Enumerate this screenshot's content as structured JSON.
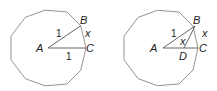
{
  "figures": [
    {
      "shape": "regular decagon",
      "labels": {
        "A": "A",
        "B": "B",
        "C": "C",
        "AB": "1",
        "AC": "1",
        "BC": "x"
      }
    },
    {
      "shape": "regular decagon",
      "labels": {
        "A": "A",
        "B": "B",
        "C": "C",
        "D": "D",
        "AB": "1",
        "BD": "x",
        "BC": "x"
      }
    }
  ],
  "colors": {
    "stroke": "#888888",
    "segment": "#555555",
    "text": "#222222"
  }
}
